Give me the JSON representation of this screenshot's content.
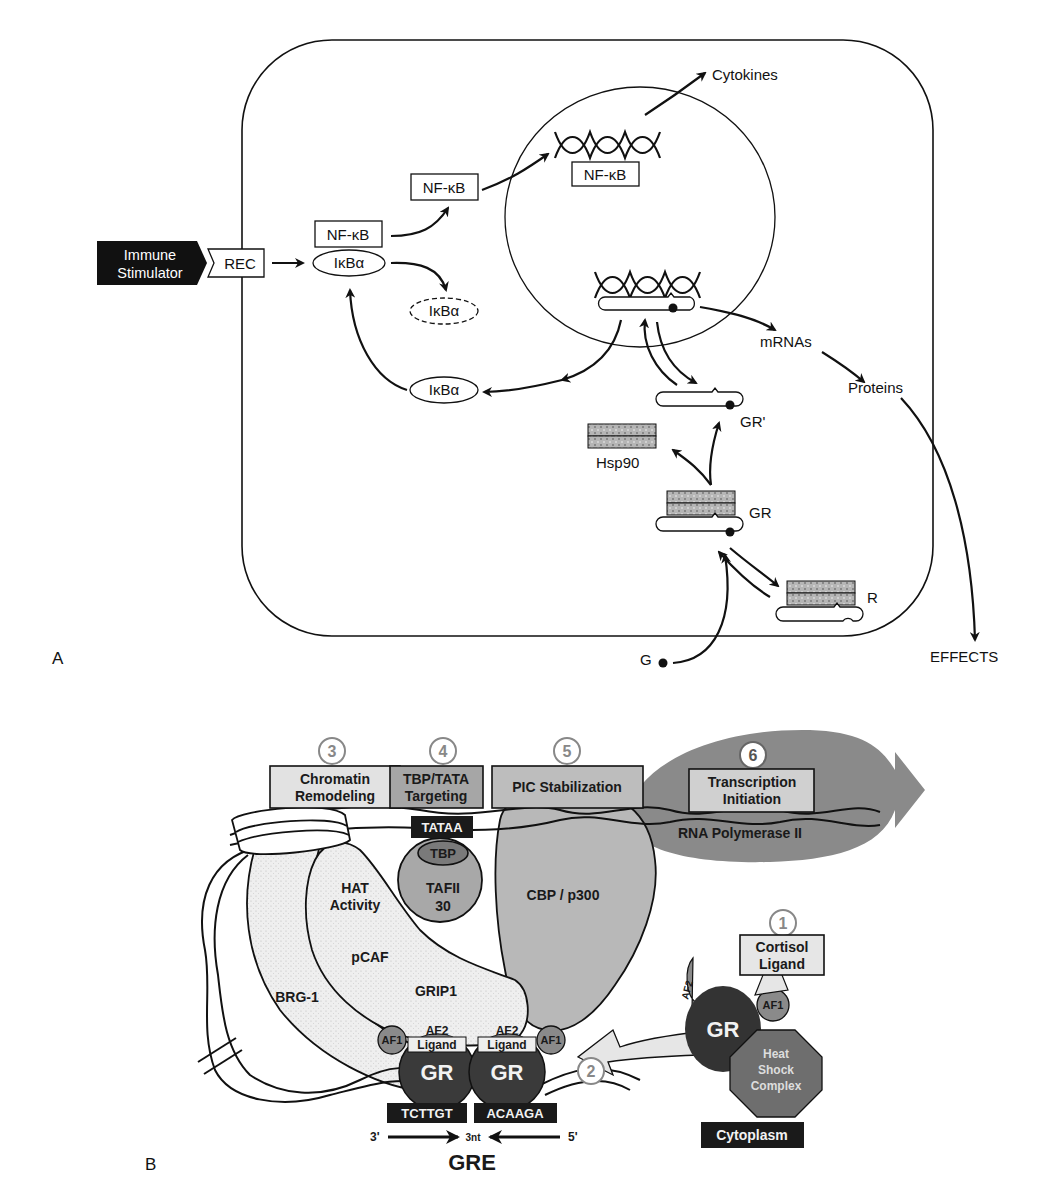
{
  "panel_a": {
    "label": "A",
    "immune_stimulator": [
      "Immune",
      "Stimulator"
    ],
    "receptor": "REC",
    "nfkb_complex": "NF-κB",
    "ikba_bound": "IκBα",
    "nfkb_free": "NF-κB",
    "ikba_degraded": "IκBα",
    "ikba_new": "IκBα",
    "nfkb_nuclear": "NF-κB",
    "cytokines": "Cytokines",
    "mrnas": "mRNAs",
    "proteins": "Proteins",
    "effects": "EFFECTS",
    "gr_prime": "GR'",
    "hsp90": "Hsp90",
    "gr": "GR",
    "r": "R",
    "g": "G"
  },
  "panel_b": {
    "label": "B",
    "steps": [
      {
        "num": "1",
        "label": [
          "Cortisol",
          "Ligand"
        ]
      },
      {
        "num": "2",
        "label": []
      },
      {
        "num": "3",
        "label": [
          "Chromatin",
          "Remodeling"
        ]
      },
      {
        "num": "4",
        "label": [
          "TBP/TATA",
          "Targeting"
        ]
      },
      {
        "num": "5",
        "label": [
          "PIC Stabilization"
        ]
      },
      {
        "num": "6",
        "label": [
          "Transcription",
          "Initiation"
        ]
      }
    ],
    "tataa": "TATAA",
    "tbp": "TBP",
    "tafii": [
      "TAFII",
      "30"
    ],
    "cbp": "CBP / p300",
    "rna_pol": "RNA Polymerase II",
    "hat": [
      "HAT",
      "Activity"
    ],
    "pcaf": "pCAF",
    "grip1": "GRIP1",
    "brg1": "BRG-1",
    "af1": "AF1",
    "af2": "AF2",
    "ligand": "Ligand",
    "gr": "GR",
    "gre_left": "TCTTGT",
    "gre_right": "ACAAGA",
    "three_prime": "3'",
    "five_prime": "5'",
    "spacer": "3nt",
    "gre": "GRE",
    "heat_shock": [
      "Heat",
      "Shock",
      "Complex"
    ],
    "cytoplasm": "Cytoplasm"
  },
  "colors": {
    "line": "#111111",
    "light_gray": "#e6e6e6",
    "mid_gray": "#a8a8a8",
    "dark_gray": "#5a5a5a",
    "gr_dark": "#333333",
    "hatch": "#9a9a9a"
  }
}
